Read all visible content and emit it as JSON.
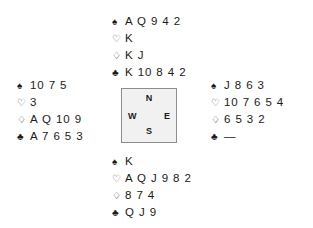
{
  "suits": {
    "spade": {
      "glyph": "♠",
      "name": "spade-symbol",
      "filled": true
    },
    "heart": {
      "glyph": "♡",
      "name": "heart-symbol",
      "filled": false
    },
    "diamond": {
      "glyph": "♢",
      "name": "diamond-symbol",
      "filled": false
    },
    "club": {
      "glyph": "♣",
      "name": "club-symbol",
      "filled": true
    }
  },
  "compass": {
    "north": "N",
    "east": "E",
    "south": "S",
    "west": "W"
  },
  "hands": {
    "north": {
      "label": "North",
      "spades": "A Q 9 4 2",
      "hearts": "K",
      "diamonds": "K J",
      "clubs": "K 10 8 4 2"
    },
    "west": {
      "label": "West",
      "spades": "10 7 5",
      "hearts": "3",
      "diamonds": "A Q 10 9",
      "clubs": "A 7 6 5 3"
    },
    "east": {
      "label": "East",
      "spades": "J 8 6 3",
      "hearts": "10 7 6 5 4",
      "diamonds": "6 5 3 2",
      "clubs": "—"
    },
    "south": {
      "label": "South",
      "spades": "K",
      "hearts": "A Q J 9 8 2",
      "diamonds": "8 7 4",
      "clubs": "Q J 9"
    }
  }
}
